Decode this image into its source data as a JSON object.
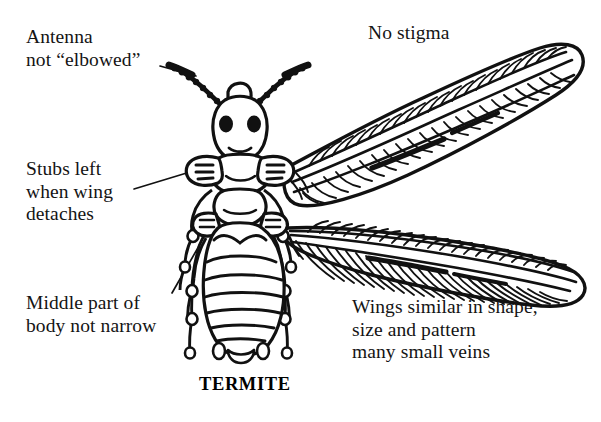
{
  "figure": {
    "subject": "TERMITE",
    "caption": "TERMITE",
    "background_color": "#ffffff",
    "ink_color": "#111111",
    "style": "black-and-white line drawing, dorsal view of a winged termite (alate) with four labelled callouts"
  },
  "labels": [
    {
      "id": "antenna",
      "name": "antenna-label",
      "lines": [
        "Antenna",
        "not “elbowed”"
      ],
      "text": "Antenna\nnot “elbowed”",
      "position": {
        "x": 26,
        "y": 26
      },
      "leader": true,
      "points_to": "left antenna"
    },
    {
      "id": "stubs",
      "name": "wing-stubs-label",
      "lines": [
        "Stubs left",
        "when wing",
        "detaches"
      ],
      "text": "Stubs left\nwhen wing\ndetaches",
      "position": {
        "x": 26,
        "y": 158
      },
      "leader": true,
      "points_to": "left wing stub on thorax"
    },
    {
      "id": "middle",
      "name": "body-waist-label",
      "lines": [
        "Middle part of",
        "body not narrow"
      ],
      "text": "Middle part of\nbody not narrow",
      "position": {
        "x": 26,
        "y": 292
      },
      "leader": true,
      "points_to": "junction of thorax and abdomen"
    },
    {
      "id": "stigma",
      "name": "no-stigma-label",
      "lines": [
        "No stigma"
      ],
      "text": "No stigma",
      "position": {
        "x": 368,
        "y": 22
      },
      "leader": false,
      "points_to": "leading edge of forewing"
    },
    {
      "id": "wings",
      "name": "wings-description-label",
      "lines": [
        "Wings similar in shape,",
        "size and pattern",
        "many small veins"
      ],
      "text": "Wings similar in shape,\nsize and pattern\nmany small veins",
      "position": {
        "x": 352,
        "y": 296
      },
      "leader": false,
      "points_to": "both pairs of wings"
    }
  ],
  "anatomy": {
    "parts": [
      "head",
      "compound-eye-left",
      "compound-eye-right",
      "antenna-left",
      "antenna-right",
      "pronotum",
      "thorax",
      "wing-stub-left",
      "wing-stub-right",
      "forewing",
      "hindwing",
      "abdomen",
      "legs"
    ],
    "antenna_segments": 11,
    "abdomen_segments": 8,
    "leg_count": 6,
    "wing_count": 2
  }
}
